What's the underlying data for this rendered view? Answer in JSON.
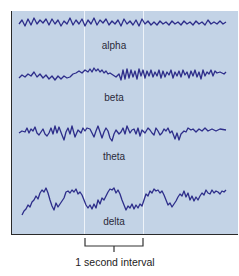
{
  "figure": {
    "wave_color": "#2d2d8a",
    "background_color": "#c3d3e6",
    "waves": [
      {
        "label": "alpha"
      },
      {
        "label": "beta"
      },
      {
        "label": "theta"
      },
      {
        "label": "delta"
      }
    ],
    "interval_caption": "1 second interval"
  }
}
